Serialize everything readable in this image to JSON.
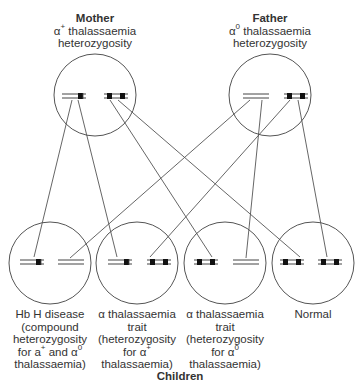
{
  "parents": [
    {
      "id": "mother",
      "name": "Mother",
      "genotype_prefix": "α",
      "genotype_sup": "+",
      "genotype_suffix": " thalassaemia",
      "status": "heterozygosity",
      "chromosomes": [
        "alpha-plus (one gene deleted)",
        "normal (two genes)"
      ]
    },
    {
      "id": "father",
      "name": "Father",
      "genotype_prefix": "α",
      "genotype_sup": "0",
      "genotype_suffix": " thalassaemia",
      "status": "heterozygosity",
      "chromosomes": [
        "alpha-zero (both genes deleted)",
        "normal (two genes)"
      ]
    }
  ],
  "children_heading": "Children",
  "children": [
    {
      "id": "hbh",
      "lines": [
        "Hb H disease",
        "(compound",
        "heterozygosity",
        "for a",
        "thalassaemia)"
      ],
      "line4_sup1": "+",
      "line4_mid": " and α",
      "line4_sup2": "0",
      "chromosomes": [
        "alpha-plus",
        "alpha-zero"
      ]
    },
    {
      "id": "trait-plus",
      "lines": [
        "α thalassaemia",
        "trait",
        "(heterozygosity",
        "for α",
        "thalassaemia)"
      ],
      "line4_sup": "+",
      "chromosomes": [
        "alpha-plus",
        "normal"
      ]
    },
    {
      "id": "trait-zero",
      "lines": [
        "α thalassaemia",
        "trait",
        "(heterozygosity",
        "for α",
        "thalassaemia)"
      ],
      "line4_sup": "0",
      "chromosomes": [
        "normal",
        "alpha-zero"
      ]
    },
    {
      "id": "normal",
      "lines": [
        "Normal"
      ],
      "chromosomes": [
        "normal",
        "normal"
      ]
    }
  ],
  "colors": {
    "line": "#555555",
    "gene": "#111111",
    "background": "#ffffff"
  }
}
